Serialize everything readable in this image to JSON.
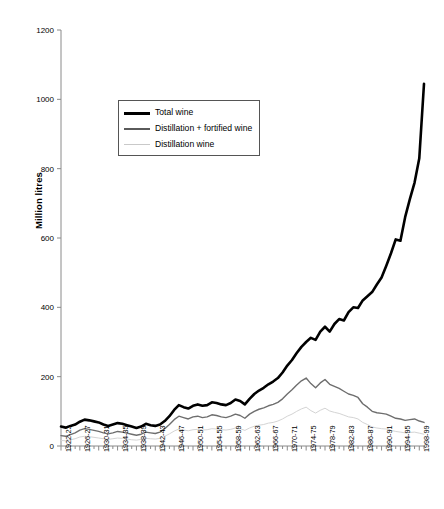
{
  "chart_data": {
    "type": "line",
    "title": "",
    "xlabel": "",
    "ylabel": "Million litres",
    "ylim": [
      0,
      1200
    ],
    "yticks": [
      0,
      200,
      400,
      600,
      800,
      1000,
      1200
    ],
    "grid": false,
    "legend_position": "upper-left-inside",
    "x_tick_labels": [
      "1922-23",
      "1926-27",
      "1930-31",
      "1934-35",
      "1938-39",
      "1942-43",
      "1946-47",
      "1950-51",
      "1954-55",
      "1958-59",
      "1962-63",
      "1966-67",
      "1970-71",
      "1974-75",
      "1978-79",
      "1982-83",
      "1986-87",
      "1990-91",
      "1994-95",
      "1998-99"
    ],
    "x_tick_step_years": 4,
    "x": [
      "1922-23",
      "1923-24",
      "1924-25",
      "1925-26",
      "1926-27",
      "1927-28",
      "1928-29",
      "1929-30",
      "1930-31",
      "1931-32",
      "1932-33",
      "1933-34",
      "1934-35",
      "1935-36",
      "1936-37",
      "1937-38",
      "1938-39",
      "1939-40",
      "1940-41",
      "1941-42",
      "1942-43",
      "1943-44",
      "1944-45",
      "1945-46",
      "1946-47",
      "1947-48",
      "1948-49",
      "1949-50",
      "1950-51",
      "1951-52",
      "1952-53",
      "1953-54",
      "1954-55",
      "1955-56",
      "1956-57",
      "1957-58",
      "1958-59",
      "1959-60",
      "1960-61",
      "1961-62",
      "1962-63",
      "1963-64",
      "1964-65",
      "1965-66",
      "1966-67",
      "1967-68",
      "1968-69",
      "1969-70",
      "1970-71",
      "1971-72",
      "1972-73",
      "1973-74",
      "1974-75",
      "1975-76",
      "1976-77",
      "1977-78",
      "1978-79",
      "1979-80",
      "1980-81",
      "1981-82",
      "1982-83",
      "1983-84",
      "1984-85",
      "1985-86",
      "1986-87",
      "1987-88",
      "1988-89",
      "1989-90",
      "1990-91",
      "1991-92",
      "1992-93",
      "1993-94",
      "1994-95",
      "1995-96",
      "1996-97",
      "1997-98",
      "1998-99",
      "1999-00"
    ],
    "series": [
      {
        "name": "Total wine",
        "color": "#000000",
        "width": 2.6,
        "values": [
          56,
          53,
          58,
          62,
          70,
          76,
          74,
          71,
          68,
          62,
          58,
          62,
          66,
          64,
          60,
          56,
          52,
          56,
          64,
          60,
          58,
          62,
          72,
          86,
          104,
          118,
          112,
          108,
          116,
          120,
          116,
          118,
          126,
          124,
          120,
          118,
          124,
          134,
          130,
          120,
          136,
          150,
          160,
          168,
          178,
          186,
          196,
          212,
          232,
          248,
          268,
          286,
          300,
          312,
          306,
          330,
          344,
          330,
          352,
          366,
          362,
          386,
          400,
          398,
          420,
          432,
          444,
          466,
          486,
          520,
          556,
          596,
          592,
          660,
          712,
          760,
          830,
          1045
        ]
      },
      {
        "name": "Distillation + fortified wine",
        "color": "#6e6e6e",
        "width": 1.4,
        "values": [
          30,
          28,
          33,
          38,
          46,
          50,
          48,
          45,
          42,
          38,
          35,
          38,
          42,
          40,
          37,
          34,
          31,
          34,
          40,
          38,
          36,
          40,
          50,
          62,
          76,
          86,
          82,
          78,
          84,
          86,
          82,
          84,
          90,
          88,
          84,
          82,
          86,
          92,
          88,
          80,
          92,
          100,
          106,
          110,
          116,
          120,
          126,
          136,
          150,
          162,
          176,
          188,
          196,
          180,
          168,
          182,
          192,
          178,
          172,
          166,
          158,
          150,
          146,
          140,
          122,
          112,
          100,
          96,
          94,
          92,
          86,
          80,
          78,
          74,
          76,
          78,
          72,
          68
        ]
      },
      {
        "name": "Distillation wine",
        "color": "#d4d4d4",
        "width": 1.0,
        "values": [
          16,
          15,
          18,
          21,
          26,
          28,
          27,
          25,
          23,
          21,
          19,
          21,
          23,
          22,
          20,
          18,
          17,
          19,
          22,
          21,
          20,
          22,
          28,
          35,
          43,
          49,
          46,
          44,
          47,
          48,
          46,
          47,
          50,
          49,
          47,
          46,
          48,
          52,
          50,
          45,
          52,
          57,
          60,
          62,
          66,
          68,
          72,
          78,
          86,
          92,
          100,
          107,
          112,
          102,
          95,
          103,
          109,
          101,
          97,
          94,
          89,
          84,
          82,
          78,
          68,
          62,
          55,
          52,
          50,
          49,
          45,
          42,
          40,
          38,
          39,
          40,
          37,
          34
        ]
      }
    ]
  },
  "legend": {
    "items": [
      {
        "label": "Total wine",
        "color": "#000000",
        "thickness": "3px"
      },
      {
        "label": "Distillation + fortified wine",
        "color": "#5a5a5a",
        "thickness": "2px"
      },
      {
        "label": "Distillation wine",
        "color": "#c9c9c9",
        "thickness": "1px"
      }
    ]
  },
  "axes": {
    "y_axis_title": "Million litres",
    "y_tick_labels": [
      "0",
      "200",
      "400",
      "600",
      "800",
      "1000",
      "1200"
    ]
  }
}
